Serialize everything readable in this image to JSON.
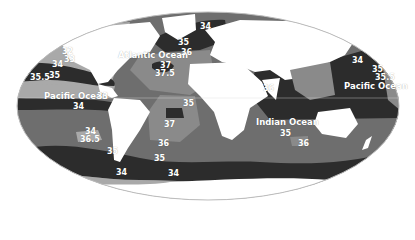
{
  "map": {
    "projection": "elliptical world map (Mollweide-like)",
    "subject": "Sea surface salinity (parts per thousand)",
    "colors": {
      "land": "#ffffff",
      "salinity_lowest": "#a9a9a9",
      "salinity_low": "#8a8a8a",
      "salinity_mid": "#6e6e6e",
      "salinity_high": "#4a4a4a",
      "salinity_highest": "#2c2c2c",
      "label_text": "#ffffff"
    },
    "ocean_labels": [
      {
        "name": "Atlantic Ocean",
        "x": 118,
        "y": 51
      },
      {
        "name": "Pacific Ocean",
        "x": 44,
        "y": 92
      },
      {
        "name": "Pacific Ocean",
        "x": 344,
        "y": 82
      },
      {
        "name": "Indian Ocean",
        "x": 256,
        "y": 118
      }
    ],
    "salinity_labels": [
      {
        "value": "32",
        "x": 62,
        "y": 48
      },
      {
        "value": "33",
        "x": 64,
        "y": 56
      },
      {
        "value": "34",
        "x": 52,
        "y": 61
      },
      {
        "value": "35",
        "x": 49,
        "y": 72
      },
      {
        "value": "35.5",
        "x": 30,
        "y": 74
      },
      {
        "value": "33",
        "x": 97,
        "y": 93
      },
      {
        "value": "34",
        "x": 73,
        "y": 103
      },
      {
        "value": "34",
        "x": 200,
        "y": 23
      },
      {
        "value": "35",
        "x": 178,
        "y": 39
      },
      {
        "value": "36",
        "x": 181,
        "y": 49
      },
      {
        "value": "37",
        "x": 160,
        "y": 62
      },
      {
        "value": "37.5",
        "x": 155,
        "y": 70
      },
      {
        "value": "35",
        "x": 183,
        "y": 100
      },
      {
        "value": "36",
        "x": 263,
        "y": 85
      },
      {
        "value": "37",
        "x": 164,
        "y": 121
      },
      {
        "value": "36",
        "x": 158,
        "y": 140
      },
      {
        "value": "35",
        "x": 154,
        "y": 155
      },
      {
        "value": "34",
        "x": 168,
        "y": 170
      },
      {
        "value": "34",
        "x": 116,
        "y": 169
      },
      {
        "value": "35",
        "x": 107,
        "y": 148
      },
      {
        "value": "34",
        "x": 85,
        "y": 128
      },
      {
        "value": "36.5",
        "x": 80,
        "y": 136
      },
      {
        "value": "35",
        "x": 280,
        "y": 130
      },
      {
        "value": "36",
        "x": 298,
        "y": 140
      },
      {
        "value": "34",
        "x": 352,
        "y": 57
      },
      {
        "value": "35",
        "x": 372,
        "y": 66
      },
      {
        "value": "35.5",
        "x": 375,
        "y": 74
      }
    ]
  }
}
